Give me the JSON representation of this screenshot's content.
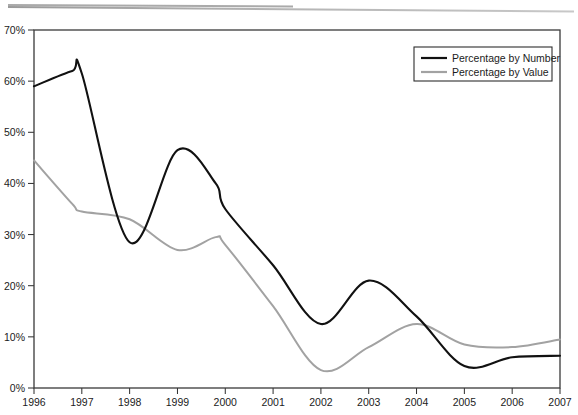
{
  "chart_data": {
    "type": "line",
    "title": "",
    "xlabel": "",
    "ylabel": "",
    "xlim": [
      1996,
      2007
    ],
    "ylim": [
      0,
      70
    ],
    "grid": false,
    "legend_position": "top-right",
    "x_tick_labels": [
      "1996",
      "1997",
      "1998",
      "1999",
      "2000",
      "2001",
      "2002",
      "2003",
      "2004",
      "2005",
      "2006",
      "2007"
    ],
    "y_tick_labels": [
      "0%",
      "10%",
      "20%",
      "30%",
      "40%",
      "50%",
      "60%",
      "70%"
    ],
    "y_tick_values": [
      0,
      10,
      20,
      30,
      40,
      50,
      60,
      70
    ],
    "x": [
      1996,
      1996.8,
      1997,
      1998,
      1999,
      1999.8,
      2000,
      2001,
      2002,
      2003,
      2004,
      2005,
      2006,
      2007
    ],
    "series": [
      {
        "name": "Percentage by Number",
        "color": "#111111",
        "values": [
          59.0,
          62.0,
          61.5,
          28.5,
          46.5,
          40.0,
          35.0,
          24.0,
          12.5,
          21.0,
          14.0,
          4.3,
          6.0,
          6.3
        ]
      },
      {
        "name": "Percentage by Value",
        "color": "#a2a2a2",
        "values": [
          44.5,
          36.0,
          34.5,
          33.0,
          27.0,
          29.5,
          28.0,
          16.0,
          3.5,
          8.0,
          12.5,
          8.5,
          8.0,
          9.5
        ]
      }
    ],
    "annotations": []
  },
  "legend": {
    "items": [
      {
        "label": "Percentage by Number",
        "color": "#111111"
      },
      {
        "label": "Percentage by Value",
        "color": "#a2a2a2"
      }
    ]
  }
}
